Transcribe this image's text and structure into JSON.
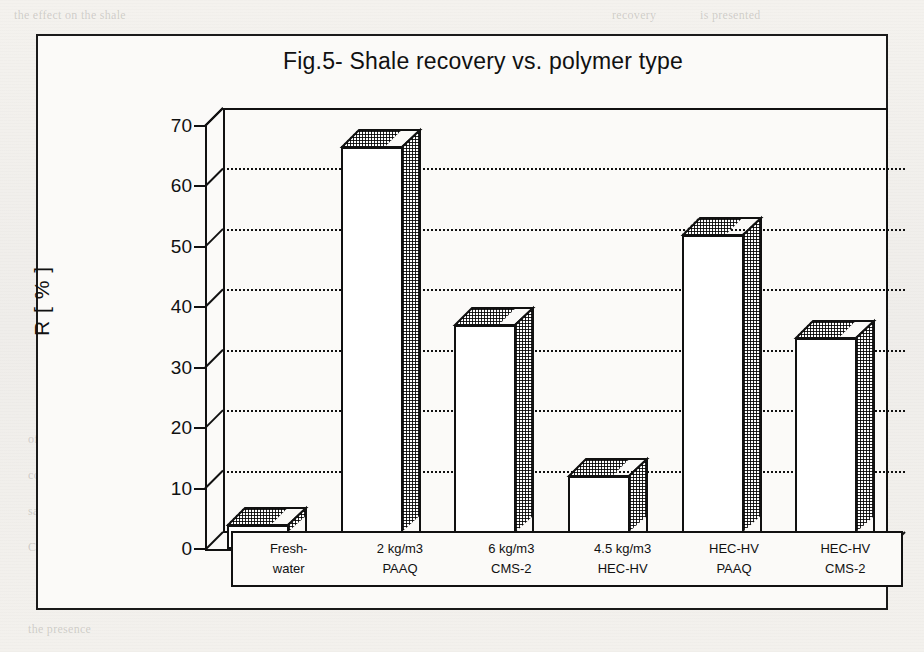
{
  "figure": {
    "title": "Fig.5- Shale recovery vs. polymer type",
    "y_axis_label": "R [ % ]"
  },
  "chart_data": {
    "type": "bar",
    "title": "Fig.5- Shale recovery vs. polymer type",
    "xlabel": "",
    "ylabel": "R [ % ]",
    "ylim": [
      0,
      70
    ],
    "yticks": [
      0,
      10,
      20,
      30,
      40,
      50,
      60,
      70
    ],
    "grid": true,
    "grid_axis": "y",
    "legend": "none",
    "style": "3d-bar",
    "categories": [
      "Fresh-\nwater",
      "2 kg/m3\nPAAQ",
      "6 kg/m3\nCMS-2",
      "4.5 kg/m3\nHEC-HV",
      "HEC-HV\nPAAQ",
      "HEC-HV\nCMS-2"
    ],
    "category_lines": [
      [
        "Fresh-",
        "water"
      ],
      [
        "2 kg/m3",
        "PAAQ"
      ],
      [
        "6 kg/m3",
        "CMS-2"
      ],
      [
        "4.5 kg/m3",
        "HEC-HV"
      ],
      [
        "HEC-HV",
        "PAAQ"
      ],
      [
        "HEC-HV",
        "CMS-2"
      ]
    ],
    "values": [
      4,
      66.5,
      37,
      12,
      52,
      35
    ],
    "series": [
      {
        "name": "Shale recovery R",
        "values": [
          4,
          66.5,
          37,
          12,
          52,
          35
        ]
      }
    ]
  },
  "yticks": [
    {
      "label": "70",
      "value": 70
    },
    {
      "label": "60",
      "value": 60
    },
    {
      "label": "50",
      "value": 50
    },
    {
      "label": "40",
      "value": 40
    },
    {
      "label": "30",
      "value": 30
    },
    {
      "label": "20",
      "value": 20
    },
    {
      "label": "10",
      "value": 10
    },
    {
      "label": "0",
      "value": 0
    }
  ],
  "page_background_text": [
    {
      "text": "the effect on the shale",
      "x": 14,
      "y": 8
    },
    {
      "text": "recovery",
      "x": 612,
      "y": 8
    },
    {
      "text": "is presented",
      "x": 700,
      "y": 8
    },
    {
      "text": "the",
      "x": 744,
      "y": 60
    },
    {
      "text": "readily",
      "x": 752,
      "y": 96
    },
    {
      "text": "polymers",
      "x": 740,
      "y": 132
    },
    {
      "text": "not likely",
      "x": 744,
      "y": 168
    },
    {
      "text": "from",
      "x": 752,
      "y": 204
    },
    {
      "text": "of the shale",
      "x": 28,
      "y": 432
    },
    {
      "text": "with",
      "x": 330,
      "y": 432
    },
    {
      "text": "polymer",
      "x": 470,
      "y": 432
    },
    {
      "text": "in",
      "x": 640,
      "y": 432
    },
    {
      "text": "the test",
      "x": 700,
      "y": 432
    },
    {
      "text": "concentration",
      "x": 28,
      "y": 468
    },
    {
      "text": "and",
      "x": 700,
      "y": 468
    },
    {
      "text": "salinity",
      "x": 28,
      "y": 504
    },
    {
      "text": "Conclusions",
      "x": 28,
      "y": 540
    },
    {
      "text": "the presence",
      "x": 28,
      "y": 622
    }
  ]
}
